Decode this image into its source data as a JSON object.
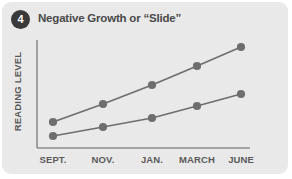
{
  "card": {
    "badge_number": "4",
    "title": "Negative Growth or “Slide”",
    "background_color": "#e9e9e9",
    "badge_color": "#3a3a3a"
  },
  "chart_data": {
    "type": "line",
    "title": "Negative Growth or “Slide”",
    "xlabel": "",
    "ylabel": "READING LEVEL",
    "categories": [
      "SEPT.",
      "NOV.",
      "JAN.",
      "MARCH",
      "JUNE"
    ],
    "grid": false,
    "legend": "none",
    "axis_color": "#8c8c8c",
    "series": [
      {
        "name": "Expected growth",
        "color": "#6e6e6e",
        "values": [
          27,
          45,
          64,
          84,
          102
        ]
      },
      {
        "name": "Slide growth",
        "color": "#6e6e6e",
        "values": [
          13,
          25,
          36,
          49,
          60
        ]
      }
    ],
    "ylim": [
      0,
      120
    ],
    "pixel_points": {
      "x": [
        53,
        103,
        152,
        197,
        241
      ],
      "series_top_y": [
        122,
        104,
        85,
        66,
        47
      ],
      "series_bottom_y": [
        136,
        127,
        118,
        106,
        94
      ]
    },
    "axes_pixels": {
      "x_axis_y": 148,
      "y_axis_x": 37,
      "x_axis_left": 37,
      "x_axis_right": 250,
      "y_axis_top": 40
    }
  }
}
